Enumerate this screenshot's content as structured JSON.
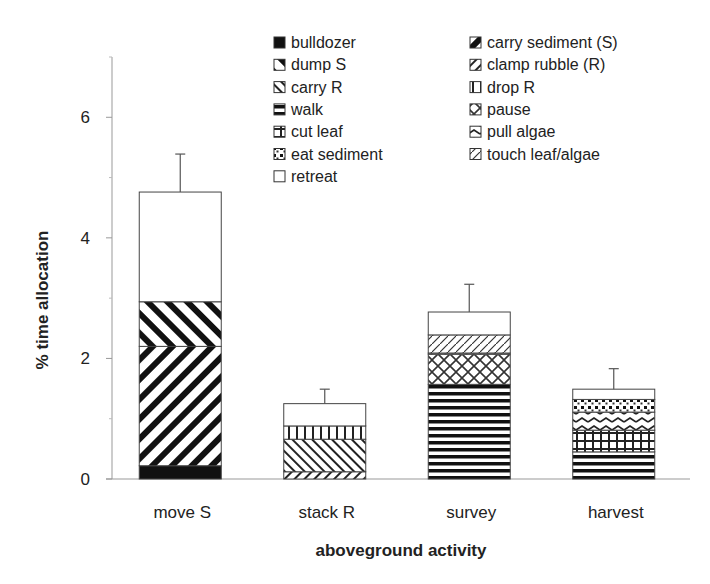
{
  "chart_data": {
    "type": "bar",
    "stacked": true,
    "title": "",
    "xlabel": "aboveground activity",
    "ylabel": "% time allocation",
    "ylim": [
      0,
      7
    ],
    "yticks": [
      0,
      2,
      4,
      6
    ],
    "yminor_ticks": [
      1,
      3,
      5
    ],
    "grid": false,
    "legend_position": "top-right",
    "categories": [
      "move S",
      "stack R",
      "survey",
      "harvest"
    ],
    "error_upper": [
      5.39,
      1.49,
      3.23,
      1.83
    ],
    "legend": [
      {
        "name": "bulldozer",
        "pattern": "solid-black"
      },
      {
        "name": "carry sediment (S)",
        "pattern": "diag-forward-wide"
      },
      {
        "name": "dump S",
        "pattern": "diag-back-wide"
      },
      {
        "name": "clamp rubble (R)",
        "pattern": "diag-forward-fine"
      },
      {
        "name": "carry R",
        "pattern": "diag-back-fine"
      },
      {
        "name": "drop R",
        "pattern": "vertical-lines"
      },
      {
        "name": "walk",
        "pattern": "horizontal-lines"
      },
      {
        "name": "pause",
        "pattern": "crosshatch-diag"
      },
      {
        "name": "cut leaf",
        "pattern": "grid"
      },
      {
        "name": "pull algae",
        "pattern": "zigzag"
      },
      {
        "name": "eat sediment",
        "pattern": "dots"
      },
      {
        "name": "touch leaf/algae",
        "pattern": "sparse-dots"
      },
      {
        "name": "retreat",
        "pattern": "white"
      }
    ],
    "series": [
      {
        "name": "bulldozer",
        "values": [
          0.22,
          0,
          0,
          0
        ]
      },
      {
        "name": "carry sediment (S)",
        "values": [
          1.98,
          0,
          0,
          0
        ]
      },
      {
        "name": "dump S",
        "values": [
          0.74,
          0,
          0,
          0
        ]
      },
      {
        "name": "clamp rubble (R)",
        "values": [
          0,
          0.12,
          0,
          0
        ]
      },
      {
        "name": "carry R",
        "values": [
          0,
          0.54,
          0,
          0
        ]
      },
      {
        "name": "drop R",
        "values": [
          0,
          0.22,
          0,
          0
        ]
      },
      {
        "name": "walk",
        "values": [
          0,
          0,
          1.57,
          0.45
        ]
      },
      {
        "name": "pause",
        "values": [
          0,
          0,
          0.5,
          0
        ]
      },
      {
        "name": "cut leaf",
        "values": [
          0,
          0,
          0,
          0.36
        ]
      },
      {
        "name": "pull algae",
        "values": [
          0,
          0,
          0,
          0.3
        ]
      },
      {
        "name": "eat sediment",
        "values": [
          0,
          0,
          0.02,
          0.21
        ]
      },
      {
        "name": "touch leaf/algae",
        "values": [
          0,
          0,
          0.3,
          0
        ]
      },
      {
        "name": "retreat",
        "values": [
          1.82,
          0.37,
          0.38,
          0.17
        ]
      }
    ]
  }
}
